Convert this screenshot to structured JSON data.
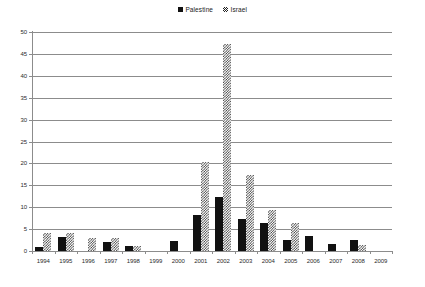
{
  "legend": {
    "position": "top-center",
    "entries": [
      {
        "label": "Palestine",
        "marker": "solid-square-swatch",
        "color": "#111111"
      },
      {
        "label": "Israel",
        "marker": "hatched-square-swatch",
        "color": "#3a3a3a"
      }
    ]
  },
  "chart_data": {
    "type": "bar",
    "title": "",
    "subtitle": "",
    "xlabel": "",
    "ylabel": "",
    "ylim": [
      0,
      50
    ],
    "yticks": [
      0,
      5,
      10,
      15,
      20,
      25,
      30,
      35,
      40,
      45,
      50
    ],
    "grid": true,
    "legend_position": "top-center",
    "categories": [
      "1994",
      "1995",
      "1996",
      "1997",
      "1998",
      "1999",
      "2000",
      "2001",
      "2002",
      "2003",
      "2004",
      "2005",
      "2006",
      "2007",
      "2008",
      "2009"
    ],
    "series": [
      {
        "name": "Palestine",
        "color": "#111111",
        "pattern": "solid",
        "values": [
          1.0,
          3.1,
          0,
          2.1,
          1.2,
          0,
          2.3,
          8.2,
          12.3,
          7.3,
          6.4,
          2.5,
          3.5,
          1.5,
          2.6,
          0
        ]
      },
      {
        "name": "Israel",
        "color": "#3a3a3a",
        "pattern": "hatched",
        "values": [
          4.0,
          4.0,
          3.0,
          3.0,
          1.1,
          0,
          0,
          20.3,
          47.2,
          17.3,
          9.4,
          6.3,
          0,
          0,
          1.3,
          0
        ]
      }
    ]
  },
  "axis": {
    "y_tick_labels": [
      "0",
      "5",
      "10",
      "15",
      "20",
      "25",
      "30",
      "35",
      "40",
      "45",
      "50"
    ],
    "x_tick_labels": [
      "1994",
      "1995",
      "1996",
      "1997",
      "1998",
      "1999",
      "2000",
      "2001",
      "2002",
      "2003",
      "2004",
      "2005",
      "2006",
      "2007",
      "2008",
      "2009"
    ]
  }
}
